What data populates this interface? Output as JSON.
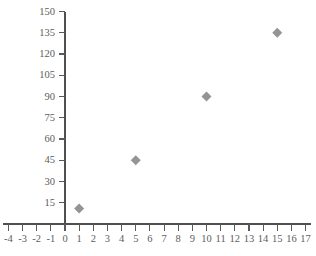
{
  "chart_data": {
    "type": "scatter",
    "title": "",
    "xlabel": "",
    "ylabel": "",
    "x": [
      1,
      5,
      10,
      15
    ],
    "values": [
      11,
      45,
      90,
      135
    ],
    "points": [
      {
        "x": 1,
        "y": 11
      },
      {
        "x": 5,
        "y": 45
      },
      {
        "x": 10,
        "y": 90
      },
      {
        "x": 15,
        "y": 135
      }
    ],
    "series": [
      {
        "name": "",
        "marker": "diamond",
        "color": "#949494",
        "values": [
          11,
          45,
          90,
          135
        ]
      }
    ],
    "xlim": [
      -4,
      17
    ],
    "ylim": [
      0,
      150
    ],
    "xticks": [
      -4,
      -3,
      -2,
      -1,
      0,
      1,
      2,
      3,
      4,
      5,
      6,
      7,
      8,
      9,
      10,
      11,
      12,
      13,
      14,
      15,
      16,
      17
    ],
    "yticks": [
      15,
      30,
      45,
      60,
      75,
      90,
      105,
      120,
      135,
      150
    ],
    "xtick_labels": [
      "-4",
      "-3",
      "-2",
      "-1",
      "0",
      "1",
      "2",
      "3",
      "4",
      "5",
      "6",
      "7",
      "8",
      "9",
      "10",
      "11",
      "12",
      "13",
      "14",
      "15",
      "16",
      "17"
    ],
    "ytick_labels": [
      "15",
      "30",
      "45",
      "60",
      "75",
      "90",
      "105",
      "120",
      "135",
      "150"
    ],
    "grid": false,
    "legend": null,
    "legend_position": "none"
  },
  "colors": {
    "marker": "#949494",
    "axis": "#4f4f4f",
    "tick_text": "#5c5c5c",
    "background": "#ffffff"
  }
}
